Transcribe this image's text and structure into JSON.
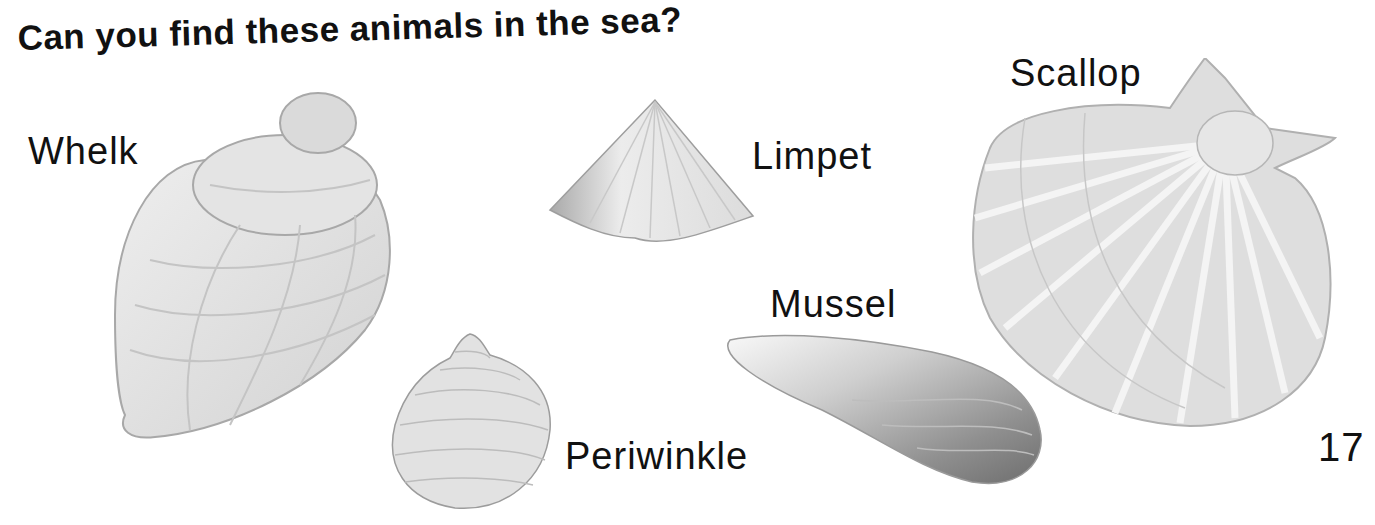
{
  "page": {
    "title": "Can you find these animals in the sea?",
    "page_number": "17"
  },
  "animals": [
    {
      "name": "Whelk"
    },
    {
      "name": "Limpet"
    },
    {
      "name": "Scallop"
    },
    {
      "name": "Mussel"
    },
    {
      "name": "Periwinkle"
    }
  ],
  "colors": {
    "text": "#111111",
    "shell_light": "#e6e6e6",
    "shell_mid": "#cfcfcf",
    "shell_dark": "#8a8a8a",
    "outline": "#a8a8a8"
  }
}
